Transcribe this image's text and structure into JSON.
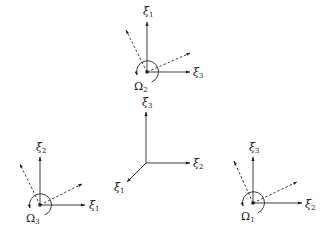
{
  "diagram": {
    "type": "coordinate-frames",
    "central_frame": {
      "origin": [
        146,
        163
      ],
      "axes": [
        {
          "label": "ξ",
          "sub": "3",
          "direction": "up"
        },
        {
          "label": "ξ",
          "sub": "2",
          "direction": "right"
        },
        {
          "label": "ξ",
          "sub": "1",
          "direction": "down-left"
        }
      ]
    },
    "frames": [
      {
        "id": "top",
        "center": [
          147,
          72
        ],
        "rotation_label": "Ω",
        "rotation_sub": "2",
        "up_axis": {
          "label": "ξ",
          "sub": "1"
        },
        "right_axis": {
          "label": "ξ",
          "sub": "3"
        }
      },
      {
        "id": "bottom-left",
        "center": [
          40,
          205
        ],
        "rotation_label": "Ω",
        "rotation_sub": "3",
        "up_axis": {
          "label": "ξ",
          "sub": "2"
        },
        "right_axis": {
          "label": "ξ",
          "sub": "1"
        }
      },
      {
        "id": "bottom-right",
        "center": [
          253,
          203
        ],
        "rotation_label": "Ω",
        "rotation_sub": "1",
        "up_axis": {
          "label": "ξ",
          "sub": "3"
        },
        "right_axis": {
          "label": "ξ",
          "sub": "2"
        }
      }
    ]
  }
}
